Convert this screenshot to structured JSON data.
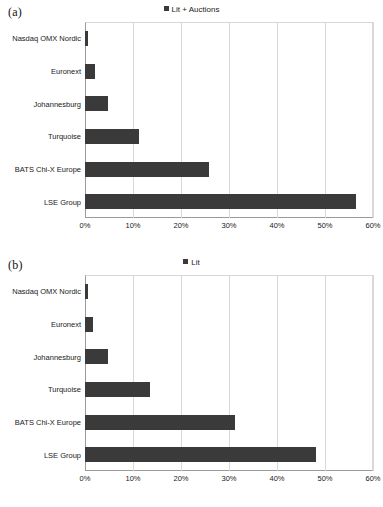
{
  "figure": {
    "panels": [
      {
        "panel_label": "(a)",
        "legend_label": "Lit + Auctions"
      },
      {
        "panel_label": "(b)",
        "legend_label": "Lit"
      }
    ]
  },
  "chart_data": [
    {
      "type": "bar",
      "orientation": "horizontal",
      "panel": "(a)",
      "title": "",
      "legend": [
        "Lit + Auctions"
      ],
      "legend_position": "top-center",
      "categories": [
        "Nasdaq OMX Nordic",
        "Euronext",
        "Johannesburg",
        "Turquoise",
        "BATS Chi-X Europe",
        "LSE Group"
      ],
      "values": [
        0.7,
        2.0,
        4.7,
        11.2,
        25.8,
        56.5
      ],
      "value_unit": "%",
      "xlabel": "",
      "ylabel": "",
      "xlim": [
        0,
        60
      ],
      "xticks": [
        0,
        10,
        20,
        30,
        40,
        50,
        60
      ],
      "xtick_labels": [
        "0%",
        "10%",
        "20%",
        "30%",
        "40%",
        "50%",
        "60%"
      ],
      "grid": true,
      "bar_color": "#3a3a3a"
    },
    {
      "type": "bar",
      "orientation": "horizontal",
      "panel": "(b)",
      "title": "",
      "legend": [
        "Lit"
      ],
      "legend_position": "top-center",
      "categories": [
        "Nasdaq OMX Nordic",
        "Euronext",
        "Johannesburg",
        "Turquoise",
        "BATS Chi-X Europe",
        "LSE Group"
      ],
      "values": [
        0.7,
        1.7,
        4.7,
        13.5,
        31.3,
        48.2
      ],
      "value_unit": "%",
      "xlabel": "",
      "ylabel": "",
      "xlim": [
        0,
        60
      ],
      "xticks": [
        0,
        10,
        20,
        30,
        40,
        50,
        60
      ],
      "xtick_labels": [
        "0%",
        "10%",
        "20%",
        "30%",
        "40%",
        "50%",
        "60%"
      ],
      "grid": true,
      "bar_color": "#3a3a3a"
    }
  ]
}
